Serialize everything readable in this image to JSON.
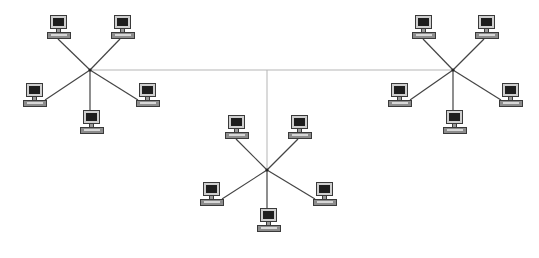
{
  "diagram": {
    "type": "extended-star-network-topology",
    "colors": {
      "background": "#ffffff",
      "star_link": "#444444",
      "backbone_link": "#b5b5b5",
      "monitor_bezel": "#cfcfcf",
      "screen": "#1e1e1e",
      "base": "#8c8c8c"
    },
    "backbone": {
      "horizontal": {
        "x1": 90,
        "y1": 70,
        "x2": 453,
        "y2": 70
      },
      "vertical": {
        "x1": 267,
        "y1": 70,
        "x2": 267,
        "y2": 170
      }
    },
    "stars": [
      {
        "id": "left",
        "hub": {
          "x": 90,
          "y": 70
        },
        "computers": [
          {
            "x": 47,
            "y": 15,
            "link_x": 58,
            "link_y": 39
          },
          {
            "x": 111,
            "y": 15,
            "link_x": 120,
            "link_y": 39
          },
          {
            "x": 23,
            "y": 83,
            "link_x": 45,
            "link_y": 100
          },
          {
            "x": 80,
            "y": 110,
            "link_x": 90,
            "link_y": 110
          },
          {
            "x": 136,
            "y": 83,
            "link_x": 138,
            "link_y": 100
          }
        ]
      },
      {
        "id": "center",
        "hub": {
          "x": 267,
          "y": 170
        },
        "computers": [
          {
            "x": 225,
            "y": 115,
            "link_x": 236,
            "link_y": 139
          },
          {
            "x": 288,
            "y": 115,
            "link_x": 298,
            "link_y": 139
          },
          {
            "x": 200,
            "y": 182,
            "link_x": 222,
            "link_y": 199
          },
          {
            "x": 257,
            "y": 208,
            "link_x": 267,
            "link_y": 208
          },
          {
            "x": 313,
            "y": 182,
            "link_x": 315,
            "link_y": 199
          }
        ]
      },
      {
        "id": "right",
        "hub": {
          "x": 453,
          "y": 70
        },
        "computers": [
          {
            "x": 412,
            "y": 15,
            "link_x": 423,
            "link_y": 39
          },
          {
            "x": 475,
            "y": 15,
            "link_x": 484,
            "link_y": 39
          },
          {
            "x": 388,
            "y": 83,
            "link_x": 410,
            "link_y": 100
          },
          {
            "x": 443,
            "y": 110,
            "link_x": 453,
            "link_y": 110
          },
          {
            "x": 499,
            "y": 83,
            "link_x": 501,
            "link_y": 100
          }
        ]
      }
    ]
  }
}
